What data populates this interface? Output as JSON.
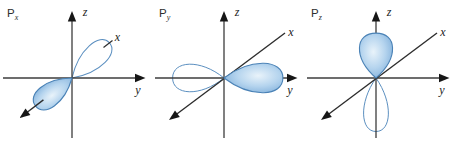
{
  "figure": {
    "background": "#ffffff",
    "panels": [
      {
        "title": "P",
        "title_sub": "x",
        "axis_labels": {
          "z": "z",
          "y": "y",
          "x": "x"
        },
        "lobes": [
          {
            "direction": "up-right",
            "style": "outline"
          },
          {
            "direction": "down-left",
            "style": "filled"
          }
        ],
        "x_axis_style": "broken"
      },
      {
        "title": "P",
        "title_sub": "y",
        "axis_labels": {
          "z": "z",
          "y": "y",
          "x": "x"
        },
        "lobes": [
          {
            "direction": "left",
            "style": "outline"
          },
          {
            "direction": "right",
            "style": "filled"
          }
        ],
        "x_axis_style": "full"
      },
      {
        "title": "P",
        "title_sub": "z",
        "axis_labels": {
          "z": "z",
          "y": "y",
          "x": "x"
        },
        "lobes": [
          {
            "direction": "up",
            "style": "filled"
          },
          {
            "direction": "down",
            "style": "outline"
          }
        ],
        "x_axis_style": "full"
      }
    ],
    "colors": {
      "axis": "#3c3c3c",
      "diagonal_axis": "#2e2e2e",
      "arrow": "#161616",
      "label_text": "#222222",
      "lobe_outline_stroke": "#5b8fc0",
      "lobe_filled_stroke": "#4a82b6",
      "lobe_gradient_center": "#e9f3fa",
      "lobe_gradient_mid": "#b5d4ee",
      "lobe_gradient_edge": "#6ba1d3"
    }
  }
}
